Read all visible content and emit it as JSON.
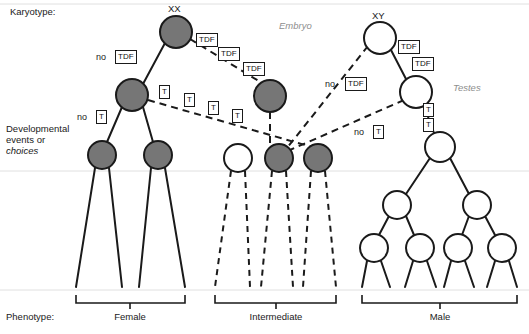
{
  "figure": {
    "width": 529,
    "height": 334,
    "background": "#ffffff",
    "colors": {
      "filled_node": "#767676",
      "open_node": "#ffffff",
      "stroke": "#1a1a1a",
      "gray_text": "#8e8e8e"
    }
  },
  "row_labels": {
    "karyotype": "Karyotype:",
    "developmental_line1": "Developmental",
    "developmental_line2": "events or",
    "developmental_line3": "choices",
    "phenotype": "Phenotype:"
  },
  "karyotypes": [
    {
      "id": "xx",
      "label": "XX"
    },
    {
      "id": "xy",
      "label": "XY"
    }
  ],
  "stage_labels": [
    {
      "id": "embryo",
      "label": "Embryo"
    },
    {
      "id": "testes",
      "label": "Testes"
    }
  ],
  "gene_boxes": [
    {
      "id": "tdf-xx-1",
      "text": "TDF",
      "x": 196,
      "y": 33
    },
    {
      "id": "tdf-xx-2",
      "text": "TDF",
      "x": 218,
      "y": 47
    },
    {
      "id": "tdf-xx-3",
      "text": "TDF",
      "x": 243,
      "y": 62
    },
    {
      "id": "no-tdf-xx",
      "text": "TDF",
      "prefix": "no",
      "x": 118,
      "y": 51,
      "prefix_x": 98,
      "prefix_y": 51
    },
    {
      "id": "t-xx-1",
      "text": "T",
      "x": 159,
      "y": 87
    },
    {
      "id": "t-xx-2",
      "text": "T",
      "x": 184,
      "y": 94
    },
    {
      "id": "t-xx-3",
      "text": "T",
      "x": 208,
      "y": 102
    },
    {
      "id": "t-xx-4",
      "text": "T",
      "x": 232,
      "y": 110
    },
    {
      "id": "no-t-xx",
      "text": "T",
      "prefix": "no",
      "x": 99,
      "y": 111,
      "prefix_x": 79,
      "prefix_y": 111
    },
    {
      "id": "tdf-xy-1",
      "text": "TDF",
      "x": 398,
      "y": 42
    },
    {
      "id": "tdf-xy-2",
      "text": "TDF",
      "x": 412,
      "y": 59
    },
    {
      "id": "no-tdf-xy",
      "text": "TDF",
      "prefix": "no",
      "x": 348,
      "y": 78,
      "prefix_x": 328,
      "prefix_y": 78
    },
    {
      "id": "t-xy-1",
      "text": "T",
      "x": 424,
      "y": 106
    },
    {
      "id": "t-xy-2",
      "text": "T",
      "x": 424,
      "y": 120
    },
    {
      "id": "no-t-xy",
      "text": "T",
      "prefix": "T",
      "x": 377,
      "y": 126,
      "prefix_x": 357,
      "prefix_y": 126,
      "prefix_text": "no"
    }
  ],
  "phenotypes": [
    {
      "id": "female",
      "label": "Female",
      "bracket_left": 76,
      "bracket_right": 185,
      "label_x": 130
    },
    {
      "id": "intermediate",
      "label": "Intermediate",
      "bracket_left": 215,
      "bracket_right": 336,
      "label_x": 276
    },
    {
      "id": "male",
      "label": "Male",
      "bracket_left": 362,
      "bracket_right": 517,
      "label_x": 440
    }
  ],
  "nodes": {
    "xx_root": {
      "cx": 176,
      "cy": 32,
      "r": 16,
      "fill": "filled"
    },
    "xx_left": {
      "cx": 132,
      "cy": 95,
      "r": 16,
      "fill": "filled"
    },
    "xx_l1": {
      "cx": 102,
      "cy": 155,
      "r": 14,
      "fill": "filled"
    },
    "xx_l2": {
      "cx": 158,
      "cy": 155,
      "r": 14,
      "fill": "filled"
    },
    "xx_mid": {
      "cx": 270,
      "cy": 96,
      "r": 16,
      "fill": "filled"
    },
    "int_open": {
      "cx": 238,
      "cy": 158,
      "r": 14,
      "fill": "open"
    },
    "int_f1": {
      "cx": 279,
      "cy": 158,
      "r": 14,
      "fill": "filled"
    },
    "int_f2": {
      "cx": 318,
      "cy": 158,
      "r": 14,
      "fill": "filled"
    },
    "xy_root": {
      "cx": 380,
      "cy": 38,
      "r": 16,
      "fill": "open"
    },
    "xy_mid": {
      "cx": 416,
      "cy": 92,
      "r": 16,
      "fill": "open"
    },
    "xy_low": {
      "cx": 440,
      "cy": 147,
      "r": 15,
      "fill": "open"
    },
    "m_l": {
      "cx": 397,
      "cy": 205,
      "r": 14,
      "fill": "open"
    },
    "m_r": {
      "cx": 477,
      "cy": 205,
      "r": 14,
      "fill": "open"
    },
    "m_ll": {
      "cx": 374,
      "cy": 248,
      "r": 14,
      "fill": "open"
    },
    "m_lr": {
      "cx": 420,
      "cy": 248,
      "r": 14,
      "fill": "open"
    },
    "m_rl": {
      "cx": 458,
      "cy": 248,
      "r": 14,
      "fill": "open"
    },
    "m_rr": {
      "cx": 502,
      "cy": 248,
      "r": 14,
      "fill": "open"
    }
  },
  "divider_lines": [
    {
      "id": "top-divider",
      "y": 4
    },
    {
      "id": "mid-divider",
      "y": 171
    },
    {
      "id": "bottom-divider",
      "y": 290
    }
  ]
}
